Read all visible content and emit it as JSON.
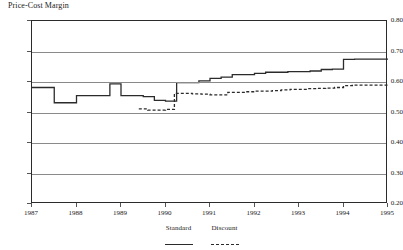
{
  "chart_data": {
    "type": "line",
    "title": "Price-Cost Margin",
    "xlabel": "",
    "ylabel": "Price-Cost Margin",
    "ylim": [
      0.2,
      0.8
    ],
    "xlim": [
      1987.0,
      1995.0
    ],
    "yticks": [
      "0.80",
      "0.70",
      "0.60",
      "0.50",
      "0.40",
      "0.30",
      "0.20"
    ],
    "ytick_values": [
      0.8,
      0.7,
      0.6,
      0.5,
      0.4,
      0.3,
      0.2
    ],
    "xticks": [
      "1987",
      "1988",
      "1989",
      "1990",
      "1991",
      "1992",
      "1993",
      "1994",
      "1995"
    ],
    "xtick_values": [
      1987,
      1988,
      1989,
      1990,
      1991,
      1992,
      1993,
      1994,
      1995
    ],
    "grid": true,
    "grid_axis": "y",
    "legend_position": "bottom-center",
    "line_color": "#2b2b2b",
    "grid_color": "#8a8a8a",
    "step_style": "post",
    "series": [
      {
        "name": "Standard",
        "style": "solid",
        "x": [
          1987.0,
          1987.25,
          1987.5,
          1987.75,
          1988.0,
          1988.25,
          1988.5,
          1988.75,
          1989.0,
          1989.25,
          1989.5,
          1989.75,
          1990.0,
          1990.25,
          1990.5,
          1990.75,
          1991.0,
          1991.25,
          1991.5,
          1991.75,
          1992.0,
          1992.25,
          1992.5,
          1992.75,
          1993.0,
          1993.25,
          1993.5,
          1993.75,
          1994.0,
          1994.25,
          1994.5,
          1994.75,
          1995.0
        ],
        "values": [
          0.582,
          0.582,
          0.532,
          0.532,
          0.555,
          0.555,
          0.555,
          0.594,
          0.555,
          0.555,
          0.552,
          0.54,
          0.537,
          0.598,
          0.598,
          0.604,
          0.612,
          0.616,
          0.624,
          0.624,
          0.628,
          0.632,
          0.632,
          0.634,
          0.634,
          0.636,
          0.641,
          0.642,
          0.674,
          0.675,
          0.675,
          0.675,
          0.675
        ]
      },
      {
        "name": "Discount",
        "style": "dashed",
        "x": [
          1989.4,
          1989.6,
          1989.8,
          1990.0,
          1990.2,
          1990.4,
          1990.6,
          1990.8,
          1991.0,
          1991.2,
          1991.4,
          1991.6,
          1991.8,
          1992.0,
          1992.2,
          1992.4,
          1992.6,
          1992.8,
          1993.0,
          1993.2,
          1993.4,
          1993.6,
          1993.8,
          1994.0,
          1994.2,
          1994.4,
          1994.6,
          1994.8,
          1995.0
        ],
        "values": [
          0.512,
          0.508,
          0.508,
          0.51,
          0.563,
          0.563,
          0.561,
          0.56,
          0.558,
          0.558,
          0.566,
          0.566,
          0.568,
          0.57,
          0.57,
          0.572,
          0.574,
          0.576,
          0.576,
          0.578,
          0.579,
          0.58,
          0.582,
          0.588,
          0.59,
          0.59,
          0.59,
          0.59,
          0.59
        ]
      }
    ]
  },
  "legend": {
    "items": [
      {
        "label": "Standard",
        "key": "solid-line-key"
      },
      {
        "label": "Discount",
        "key": "dashed-line-key"
      }
    ]
  }
}
